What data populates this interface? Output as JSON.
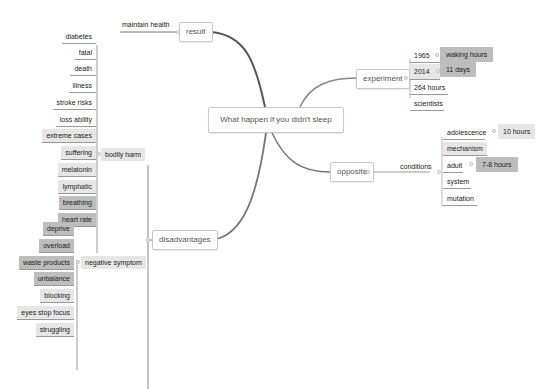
{
  "map": {
    "central": "What happen if you didn't sleep",
    "branches": {
      "result": {
        "label": "result",
        "children": [
          "maintain health"
        ]
      },
      "experiment": {
        "label": "experiment",
        "children": [
          {
            "label": "1965",
            "child": "waking hours"
          },
          {
            "label": "2014",
            "child": "11 days"
          },
          {
            "label": "264 hours"
          },
          {
            "label": "scientists"
          }
        ]
      },
      "opposite": {
        "label": "opposite",
        "conditions": {
          "label": "conditions",
          "children": [
            {
              "label": "adolescence",
              "child": "10 hours"
            },
            {
              "label": "mechanism"
            },
            {
              "label": "adult",
              "child": "7-8 hours"
            },
            {
              "label": "system"
            },
            {
              "label": "mutation"
            }
          ]
        }
      },
      "disadvantages": {
        "label": "disadvantages",
        "bodily_harm": {
          "label": "bodily harm",
          "children": [
            "diabetes",
            "fatal",
            "death",
            "illness",
            "stroke risks",
            "loss ability",
            "extreme cases",
            "suffering",
            "melatonin",
            "lymphatic",
            "breathing",
            "heart rate"
          ]
        },
        "negative_symptom": {
          "label": "negative symptom",
          "children": [
            "deprive",
            "overload",
            "waste products",
            "unbalance",
            "blocking",
            "eyes stop focus",
            "struggling"
          ]
        }
      }
    }
  },
  "colors": {
    "line": "#666666",
    "highlight_light": "#e6e6e6",
    "highlight_dark": "#bdbdbd",
    "border": "#c8c8c8"
  }
}
